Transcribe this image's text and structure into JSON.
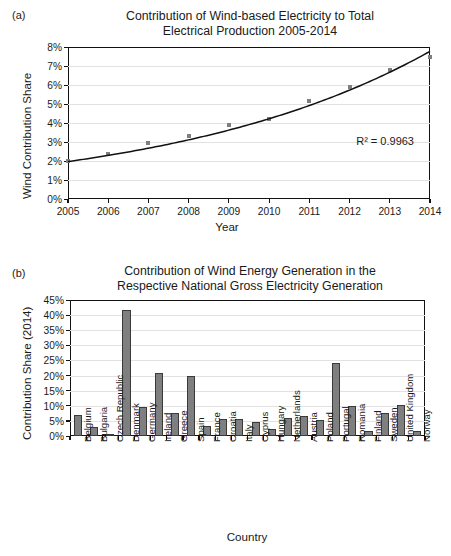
{
  "figure": {
    "panel_a_letter": "(a)",
    "panel_b_letter": "(b)"
  },
  "chart_data": [
    {
      "id": "panel_a",
      "type": "line",
      "title": "Contribution of Wind-based Electricity to Total Electrical Production 2005-2014",
      "title_line1": "Contribution of Wind-based Electricity to Total",
      "title_line2": "Electrical Production 2005-2014",
      "xlabel": "Year",
      "ylabel": "Wind Contribution Share",
      "x": [
        2005,
        2006,
        2007,
        2008,
        2009,
        2010,
        2011,
        2012,
        2013,
        2014
      ],
      "xtick_labels": [
        "2005",
        "2006",
        "2007",
        "2008",
        "2009",
        "2010",
        "2011",
        "2012",
        "2013",
        "2014"
      ],
      "values": [
        2.0,
        2.35,
        2.95,
        3.3,
        3.9,
        4.2,
        5.15,
        5.9,
        6.8,
        7.5
      ],
      "ytick_labels": [
        "0%",
        "1%",
        "2%",
        "3%",
        "4%",
        "5%",
        "6%",
        "7%",
        "8%"
      ],
      "yticks": [
        0,
        1,
        2,
        3,
        4,
        5,
        6,
        7,
        8
      ],
      "ylim": [
        0,
        8
      ],
      "grid": true,
      "legend": "none",
      "annotation": "R² = 0.9963",
      "series_name": "Wind Contribution Share",
      "marker_color": "#7f7f7f",
      "line_color": "#111111"
    },
    {
      "id": "panel_b",
      "type": "bar",
      "title": "Contribution of Wind Energy Generation in the Respective National Gross Electricity Generation",
      "title_line1": "Contribution of Wind Energy Generation in the",
      "title_line2": "Respective National Gross Electricity Generation",
      "xlabel": "Country",
      "ylabel": "Contribution Share (2014)",
      "categories": [
        "Belgium",
        "Bulgaria",
        "Czech Republic",
        "Denmark",
        "Germany",
        "Ireland",
        "Greece",
        "Spain",
        "France",
        "Croatia",
        "Italy",
        "Cyprus",
        "Hungary",
        "Netherlands",
        "Austria",
        "Poland",
        "Portugal",
        "Romania",
        "Finland",
        "Sweden",
        "United Kingdom",
        "Norway"
      ],
      "values": [
        6.8,
        3.1,
        0.6,
        41.8,
        9.7,
        21.0,
        7.7,
        19.8,
        3.4,
        5.6,
        5.7,
        4.7,
        2.4,
        5.9,
        6.5,
        5.3,
        24.1,
        10.0,
        1.8,
        7.7,
        10.1,
        1.7
      ],
      "ytick_labels": [
        "0%",
        "5%",
        "10%",
        "15%",
        "20%",
        "25%",
        "30%",
        "35%",
        "40%",
        "45%"
      ],
      "yticks": [
        0,
        5,
        10,
        15,
        20,
        25,
        30,
        35,
        40,
        45
      ],
      "ylim": [
        0,
        45
      ],
      "grid": true,
      "legend": "none",
      "bar_color": "#7f7f7f",
      "bar_edge_color": "#3a3a3a"
    }
  ]
}
